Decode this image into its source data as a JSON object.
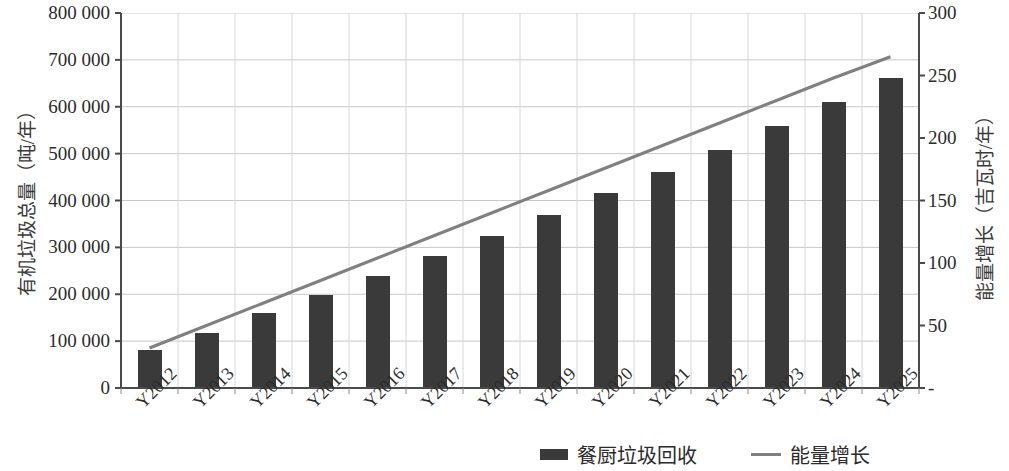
{
  "chart_data": {
    "type": "bar",
    "title": "",
    "subtitle": "",
    "xlabel": "",
    "ylabel": "有机垃圾总量（吨/年）",
    "y2label": "能量增长（吉瓦时/年）",
    "grid": true,
    "legend_position": "bottom",
    "categories": [
      "Y2012",
      "Y2013",
      "Y2014",
      "Y2015",
      "Y2016",
      "Y2017",
      "Y2018",
      "Y2019",
      "Y2020",
      "Y2021",
      "Y2022",
      "Y2023",
      "Y2024",
      "Y2025"
    ],
    "ylim": [
      0,
      800000
    ],
    "yticks": [
      0,
      100000,
      200000,
      300000,
      400000,
      500000,
      600000,
      700000,
      800000
    ],
    "ytick_labels": [
      "0",
      "100 000",
      "200 000",
      "300 000",
      "400 000",
      "500 000",
      "600 000",
      "700 000",
      "800 000"
    ],
    "y2lim": [
      0,
      300
    ],
    "y2ticks": [
      0,
      50,
      100,
      150,
      200,
      250,
      300
    ],
    "y2tick_labels": [
      "-",
      "50",
      "100",
      "150",
      "200",
      "250",
      "300"
    ],
    "series": [
      {
        "name": "餐厨垃圾回收",
        "type": "bar",
        "axis": "left",
        "color": "#3a3a3a",
        "values": [
          81000,
          118000,
          160000,
          199000,
          240000,
          281000,
          325000,
          369000,
          415000,
          461000,
          508000,
          558000,
          610000,
          661000
        ]
      },
      {
        "name": "能量增长",
        "type": "line",
        "axis": "right",
        "color": "#808080",
        "values": [
          32,
          50,
          68,
          86,
          104,
          122,
          140,
          158,
          176,
          194,
          212,
          230,
          248,
          265
        ]
      }
    ]
  },
  "legend": {
    "entries": [
      {
        "label": "餐厨垃圾回收",
        "marker": "bar-swatch"
      },
      {
        "label": "能量增长",
        "marker": "line-swatch"
      }
    ]
  }
}
